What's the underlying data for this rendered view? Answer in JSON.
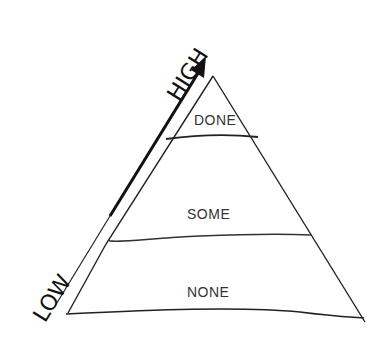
{
  "diagram": {
    "type": "pyramid",
    "levels": [
      {
        "label": "DONE",
        "position": "top"
      },
      {
        "label": "SOME",
        "position": "middle"
      },
      {
        "label": "NONE",
        "position": "bottom"
      }
    ],
    "axis": {
      "high_label": "HIGH",
      "low_label": "LOW",
      "direction": "low-to-high upward arrow along left edge"
    },
    "colors": {
      "stroke": "#222222",
      "text": "#333333",
      "background": "#ffffff"
    }
  }
}
